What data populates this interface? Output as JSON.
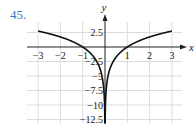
{
  "problem_number": "45.",
  "colors": {
    "problem_number": "#3b78c0",
    "curve": "#111111",
    "grid": "#dcdcdc",
    "axis": "#222222"
  },
  "chart_data": {
    "type": "line",
    "title": "",
    "xlabel": "x",
    "ylabel": "y",
    "xlim": [
      -3.5,
      3.5
    ],
    "ylim": [
      -13,
      4
    ],
    "grid": true,
    "x_ticks": [
      -3,
      -2,
      -1,
      1,
      2,
      3
    ],
    "x_tick_labels": [
      "−3",
      "−2",
      "−1",
      "1",
      "2",
      "3"
    ],
    "y_ticks": [
      2.5,
      -2.5,
      -5,
      -7.5,
      -10,
      -12.5
    ],
    "y_tick_labels": [
      "2.5",
      "−2.5",
      "−5",
      "−7.5",
      "−10",
      "−12.5"
    ],
    "series": [
      {
        "name": "y = 2.5 ln|x| (left branch)",
        "x": [
          -3,
          -2.5,
          -2,
          -1.5,
          -1,
          -0.75,
          -0.5,
          -0.3,
          -0.2,
          -0.1,
          -0.05,
          -0.01
        ],
        "y": [
          2.75,
          2.29,
          1.73,
          1.01,
          0,
          -0.72,
          -1.73,
          -3.01,
          -4.02,
          -5.76,
          -7.49,
          -11.51
        ]
      },
      {
        "name": "y = 2.5 ln|x| (right branch)",
        "x": [
          0.01,
          0.05,
          0.1,
          0.2,
          0.3,
          0.5,
          0.75,
          1,
          1.5,
          2,
          2.5,
          3
        ],
        "y": [
          -11.51,
          -7.49,
          -5.76,
          -4.02,
          -3.01,
          -1.73,
          -0.72,
          0,
          1.01,
          1.73,
          2.29,
          2.75
        ]
      }
    ]
  }
}
